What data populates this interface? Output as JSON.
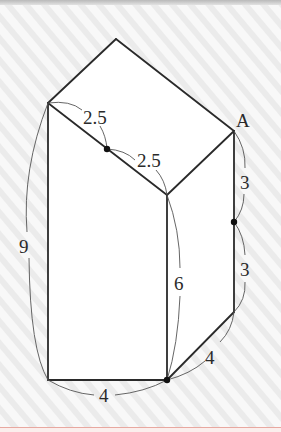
{
  "figure": {
    "point_labels": {
      "A": "A"
    },
    "measurements": {
      "upper_diag_half_1": "2.5",
      "upper_diag_half_2": "2.5",
      "right_edge_upper": "3",
      "right_edge_lower": "3",
      "left_height": "9",
      "middle_height": "6",
      "bottom_slant": "4",
      "bottom_base": "4"
    },
    "colors": {
      "line": "#2a2a2a",
      "background": "#f7f7f7",
      "stripe": "#eaeaea",
      "face": "#ffffff",
      "bottom_rule": "#e8a8a0"
    }
  }
}
